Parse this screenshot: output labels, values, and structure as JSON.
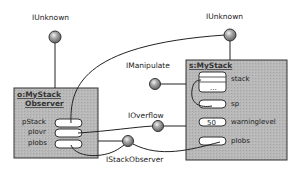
{
  "diagram": {
    "colors": {
      "box_fill": "#b4b4b4",
      "stroke": "#333333",
      "slot_fill": "#ffffff",
      "lollipop_fill": "#9a9a9a"
    },
    "interfaces": {
      "iunknown_left": "IUnknown",
      "iunknown_right": "IUnknown",
      "imanipulate": "IManipulate",
      "ioverflow": "IOverflow",
      "istackobserver": "IStackObserver"
    },
    "observer": {
      "title_line1": "o:MyStack",
      "title_line2": "Observer",
      "fields": [
        "pStack",
        "pIovr",
        "pIobs"
      ]
    },
    "stack": {
      "title": "s:MyStack",
      "fields": {
        "stack": "stack",
        "stack_ellipsis": "...",
        "sp": "sp",
        "warninglevel": "warninglevel",
        "warninglevel_value": "50",
        "piobs": "pIobs"
      }
    }
  }
}
